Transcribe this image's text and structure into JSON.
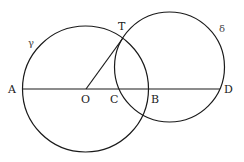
{
  "diagram": {
    "type": "geometry",
    "colors": {
      "stroke": "#1a1a1a",
      "background": "#ffffff"
    },
    "circles": [
      {
        "name": "gamma",
        "label": "γ",
        "cx": 85.5,
        "cy": 89,
        "r": 63
      },
      {
        "name": "delta",
        "label": "δ",
        "cx": 169.5,
        "cy": 67,
        "r": 54
      }
    ],
    "segments": [
      {
        "name": "line-AD",
        "from": "A",
        "to": "D"
      },
      {
        "name": "segment-OT",
        "from": "O",
        "to": "T"
      }
    ],
    "points": {
      "A": {
        "label": "A",
        "x": 23,
        "y": 89
      },
      "O": {
        "label": "O",
        "x": 86,
        "y": 89
      },
      "C": {
        "label": "C",
        "x": 118,
        "y": 89
      },
      "B": {
        "label": "B",
        "x": 148,
        "y": 89
      },
      "D": {
        "label": "D",
        "x": 220,
        "y": 89
      },
      "T": {
        "label": "T",
        "x": 123,
        "y": 38
      }
    },
    "labels": {
      "A": "A",
      "O": "O",
      "C": "C",
      "B": "B",
      "D": "D",
      "T": "T",
      "gamma": "γ",
      "delta": "δ"
    }
  }
}
